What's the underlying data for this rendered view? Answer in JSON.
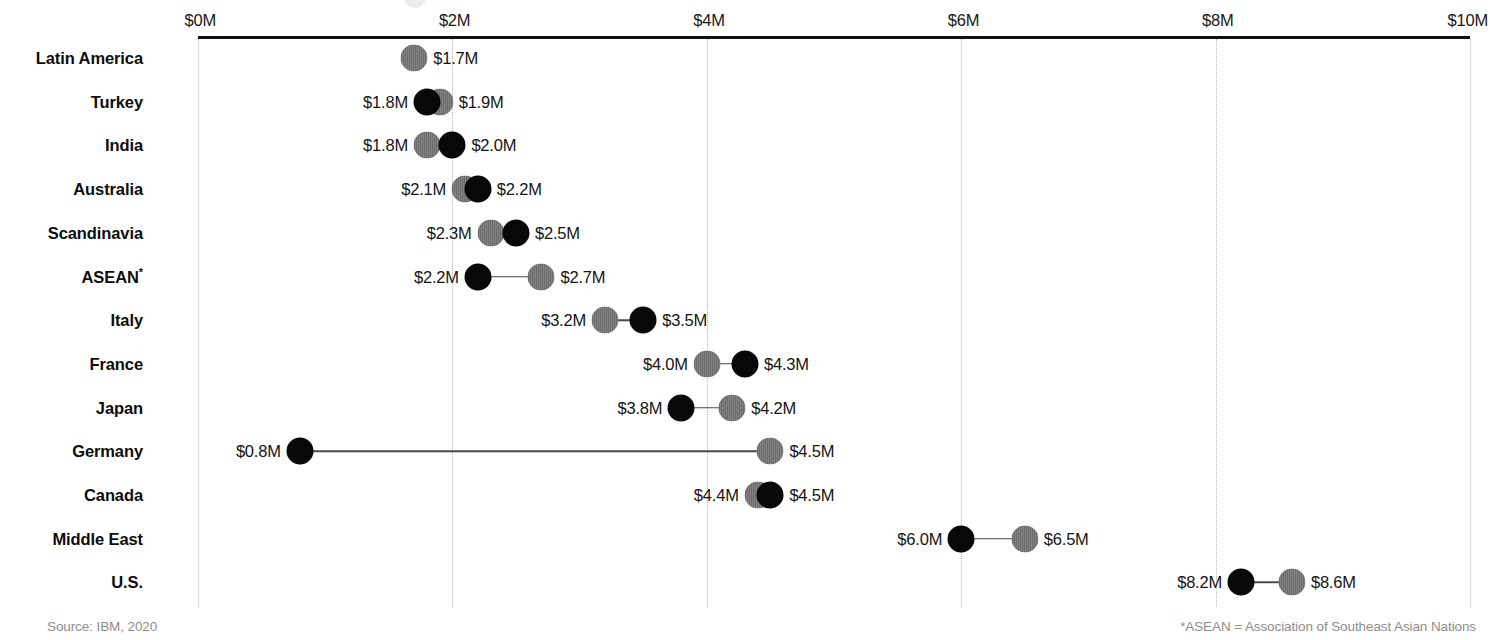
{
  "chart_data": {
    "type": "scatter",
    "subtype": "dumbbell",
    "title": "",
    "xlabel": "",
    "ylabel": "",
    "xlim": [
      0,
      10
    ],
    "xtick_labels": [
      "$0M",
      "$2M",
      "$4M",
      "$6M",
      "$8M",
      "$10M"
    ],
    "xticks": [
      0,
      2,
      4,
      6,
      8,
      10
    ],
    "grid": true,
    "legend": "none",
    "unit": "$M",
    "series": [
      {
        "name": "black-marker",
        "color": "#080808"
      },
      {
        "name": "gray-marker",
        "color": "#737373"
      }
    ],
    "categories": [
      "Latin America",
      "Turkey",
      "India",
      "Australia",
      "Scandinavia",
      "ASEAN",
      "Italy",
      "France",
      "Japan",
      "Germany",
      "Canada",
      "Middle East",
      "U.S."
    ],
    "rows": [
      {
        "category": "Latin America",
        "footnote": false,
        "points": [
          {
            "series": "gray-marker",
            "value": 1.7,
            "label": "$1.7M",
            "label_side": "right"
          }
        ]
      },
      {
        "category": "Turkey",
        "footnote": false,
        "points": [
          {
            "series": "black-marker",
            "value": 1.8,
            "label": "$1.8M",
            "label_side": "left"
          },
          {
            "series": "gray-marker",
            "value": 1.9,
            "label": "$1.9M",
            "label_side": "right"
          }
        ]
      },
      {
        "category": "India",
        "footnote": false,
        "points": [
          {
            "series": "gray-marker",
            "value": 1.8,
            "label": "$1.8M",
            "label_side": "left"
          },
          {
            "series": "black-marker",
            "value": 2.0,
            "label": "$2.0M",
            "label_side": "right"
          }
        ]
      },
      {
        "category": "Australia",
        "footnote": false,
        "points": [
          {
            "series": "gray-marker",
            "value": 2.1,
            "label": "$2.1M",
            "label_side": "left"
          },
          {
            "series": "black-marker",
            "value": 2.2,
            "label": "$2.2M",
            "label_side": "right"
          }
        ]
      },
      {
        "category": "Scandinavia",
        "footnote": false,
        "points": [
          {
            "series": "gray-marker",
            "value": 2.3,
            "label": "$2.3M",
            "label_side": "left"
          },
          {
            "series": "black-marker",
            "value": 2.5,
            "label": "$2.5M",
            "label_side": "right"
          }
        ]
      },
      {
        "category": "ASEAN",
        "footnote": true,
        "points": [
          {
            "series": "black-marker",
            "value": 2.2,
            "label": "$2.2M",
            "label_side": "left"
          },
          {
            "series": "gray-marker",
            "value": 2.7,
            "label": "$2.7M",
            "label_side": "right"
          }
        ]
      },
      {
        "category": "Italy",
        "footnote": false,
        "points": [
          {
            "series": "gray-marker",
            "value": 3.2,
            "label": "$3.2M",
            "label_side": "left"
          },
          {
            "series": "black-marker",
            "value": 3.5,
            "label": "$3.5M",
            "label_side": "right"
          }
        ]
      },
      {
        "category": "France",
        "footnote": false,
        "points": [
          {
            "series": "gray-marker",
            "value": 4.0,
            "label": "$4.0M",
            "label_side": "left"
          },
          {
            "series": "black-marker",
            "value": 4.3,
            "label": "$4.3M",
            "label_side": "right"
          }
        ]
      },
      {
        "category": "Japan",
        "footnote": false,
        "points": [
          {
            "series": "black-marker",
            "value": 3.8,
            "label": "$3.8M",
            "label_side": "left"
          },
          {
            "series": "gray-marker",
            "value": 4.2,
            "label": "$4.2M",
            "label_side": "right"
          }
        ]
      },
      {
        "category": "Germany",
        "footnote": false,
        "points": [
          {
            "series": "black-marker",
            "value": 0.8,
            "label": "$0.8M",
            "label_side": "left"
          },
          {
            "series": "gray-marker",
            "value": 4.5,
            "label": "$4.5M",
            "label_side": "right"
          }
        ]
      },
      {
        "category": "Canada",
        "footnote": false,
        "points": [
          {
            "series": "gray-marker",
            "value": 4.4,
            "label": "$4.4M",
            "label_side": "left"
          },
          {
            "series": "black-marker",
            "value": 4.5,
            "label": "$4.5M",
            "label_side": "right"
          }
        ]
      },
      {
        "category": "Middle East",
        "footnote": false,
        "points": [
          {
            "series": "black-marker",
            "value": 6.0,
            "label": "$6.0M",
            "label_side": "left"
          },
          {
            "series": "gray-marker",
            "value": 6.5,
            "label": "$6.5M",
            "label_side": "right"
          }
        ]
      },
      {
        "category": "U.S.",
        "footnote": false,
        "points": [
          {
            "series": "black-marker",
            "value": 8.2,
            "label": "$8.2M",
            "label_side": "left"
          },
          {
            "series": "gray-marker",
            "value": 8.6,
            "label": "$8.6M",
            "label_side": "right"
          }
        ]
      }
    ]
  },
  "footer": {
    "source": "Source: IBM, 2020",
    "note": "*ASEAN = Association of Southeast Asian Nations"
  },
  "colors": {
    "black_marker": "#080808",
    "gray_marker": "#737373",
    "axis": "#111111",
    "gridline": "#b6b6b6",
    "footer_text": "#8d8d8d"
  }
}
